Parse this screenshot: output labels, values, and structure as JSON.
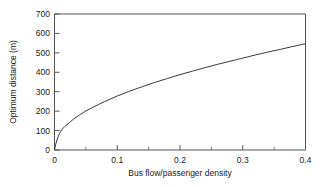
{
  "chart_data": {
    "type": "line",
    "title": "",
    "xlabel": "Bus flow/passenger density",
    "ylabel": "Optimum distance (m)",
    "xlim": [
      0,
      0.4
    ],
    "ylim": [
      0,
      700
    ],
    "grid": false,
    "legend": null,
    "xticks": [
      0,
      0.1,
      0.2,
      0.3,
      0.4
    ],
    "xtick_labels": [
      "0",
      "0.1",
      "0.2",
      "0.3",
      "0.4"
    ],
    "xticks_minor": [
      0.05,
      0.15,
      0.25,
      0.35
    ],
    "yticks": [
      0,
      100,
      200,
      300,
      400,
      500,
      600,
      700
    ],
    "ytick_labels": [
      "0",
      "100",
      "200",
      "300",
      "400",
      "500",
      "600",
      "700"
    ],
    "series": [
      {
        "name": "Optimum distance",
        "color": "#3a3a3a",
        "x": [
          0.0,
          0.002,
          0.005,
          0.008,
          0.012,
          0.016,
          0.02,
          0.025,
          0.03,
          0.04,
          0.05,
          0.06,
          0.07,
          0.08,
          0.09,
          0.1,
          0.12,
          0.14,
          0.16,
          0.18,
          0.2,
          0.22,
          0.24,
          0.26,
          0.28,
          0.3,
          0.32,
          0.34,
          0.36,
          0.38,
          0.4
        ],
        "y": [
          0,
          30,
          62,
          86,
          106,
          120,
          131,
          145,
          158,
          181,
          201,
          218,
          234,
          249,
          264,
          278,
          303,
          326,
          348,
          368,
          388,
          406,
          424,
          441,
          457,
          473,
          489,
          504,
          518,
          533,
          547
        ]
      }
    ]
  },
  "axes": {
    "y_axis_label": "Optimum distance (m)",
    "x_axis_label": "Bus flow/passenger density"
  }
}
